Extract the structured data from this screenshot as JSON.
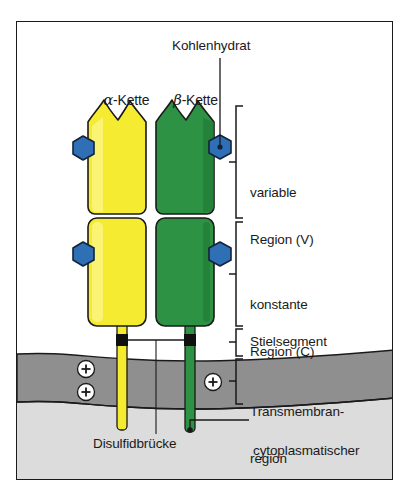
{
  "figure": {
    "kind": "t-cell-receptor-schematic",
    "language": "de",
    "background_color": "#ffffff",
    "frame_color": "#1a1a1a"
  },
  "labels": {
    "carbohydrate": "Kohlenhydrat",
    "alpha_chain_greek": "α",
    "alpha_chain_rest": "-Kette",
    "beta_chain_greek": "β",
    "beta_chain_rest": "-Kette",
    "variable_region_line1": "variable",
    "variable_region_line2": "Region (V)",
    "constant_region_line1": "konstante",
    "constant_region_line2": "Region (C)",
    "stalk_segment": "Stielsegment",
    "transmembrane_line1": "Transmembran-",
    "transmembrane_line2": "region",
    "cytoplasmic_tail_line1": "cytoplasmatischer",
    "cytoplasmic_tail_line2": "Schwanz",
    "disulfide_bridge": "Disulfidbrücke",
    "charge_plus": "+"
  },
  "colors": {
    "alpha_chain_fill": "#f5eb30",
    "alpha_chain_fill_light": "#fbf58a",
    "alpha_chain_stroke": "#1a1a1a",
    "beta_chain_fill": "#2e9245",
    "beta_chain_fill_dark": "#1f7a36",
    "beta_chain_stroke": "#1a1a1a",
    "carbohydrate_fill": "#2f6fb5",
    "carbohydrate_stroke": "#12233a",
    "membrane_fill": "#8f8f8f",
    "cytoplasm_fill": "#dcdcdc",
    "outline": "#1a1a1a",
    "charge_fill": "#ffffff"
  },
  "structures": {
    "chains": [
      {
        "name": "alpha",
        "label": "α-Kette",
        "color": "#f5eb30"
      },
      {
        "name": "beta",
        "label": "β-Kette",
        "color": "#2e9245"
      }
    ],
    "carbohydrate_count": 4,
    "charges": [
      {
        "chain": "alpha",
        "symbol": "+"
      },
      {
        "chain": "alpha",
        "symbol": "+"
      },
      {
        "chain": "beta",
        "symbol": "+"
      }
    ],
    "brackets": [
      {
        "name": "variable-region",
        "label": "variable Region (V)"
      },
      {
        "name": "constant-region",
        "label": "konstante Region (C)"
      },
      {
        "name": "stalk-segment",
        "label": "Stielsegment"
      },
      {
        "name": "transmembrane-region",
        "label": "Transmembranregion"
      }
    ]
  }
}
